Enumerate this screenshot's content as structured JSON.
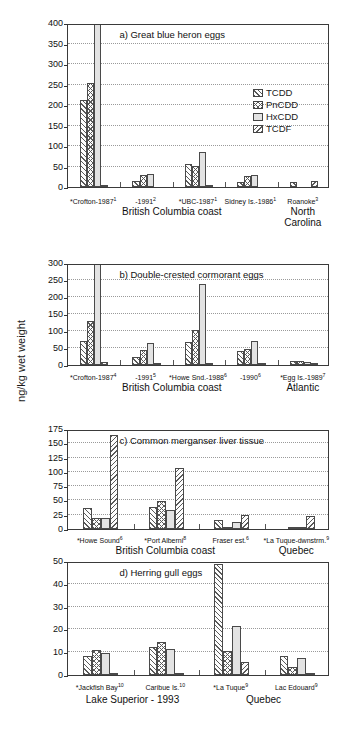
{
  "figure": {
    "ylabel": "ng/kg wet weight"
  },
  "legend": {
    "items": [
      {
        "label": "TCDD",
        "pattern": "diagonal-forward-hatch",
        "color": "#ffffff"
      },
      {
        "label": "PnCDD",
        "pattern": "cross-hatch",
        "color": "#ffffff"
      },
      {
        "label": "HxCDD",
        "pattern": "solid-light-gray",
        "color": "#e3e3e3"
      },
      {
        "label": "TCDF",
        "pattern": "diagonal-back-hatch",
        "color": "#ffffff"
      }
    ]
  },
  "chart_data": [
    {
      "type": "bar",
      "panel": "a",
      "title": "a) Great blue heron eggs",
      "xlabel": "",
      "ylabel": "ng/kg wet weight",
      "ylim": [
        0,
        400
      ],
      "yticks": [
        0,
        50,
        100,
        150,
        200,
        250,
        300,
        350,
        400
      ],
      "grid": true,
      "legend_position": "right-middle",
      "categories": [
        "*Crofton-1987",
        "-1991",
        "*UBC-1987",
        "Sidney Is.-1986",
        "Roanoke"
      ],
      "category_footnotes": [
        "1",
        "2",
        "1",
        "1",
        "3"
      ],
      "series": [
        {
          "name": "TCDD",
          "values": [
            213,
            15,
            57,
            12,
            13
          ]
        },
        {
          "name": "PnCDD",
          "values": [
            254,
            30,
            52,
            26,
            0
          ]
        },
        {
          "name": "HxCDD",
          "values": [
            400,
            32,
            85,
            29,
            0
          ]
        },
        {
          "name": "TCDF",
          "values": [
            3,
            0,
            3,
            0,
            14
          ]
        }
      ],
      "groups": [
        {
          "label": "British Columbia coast",
          "span": 4
        },
        {
          "label": "North Carolina",
          "span": 1
        }
      ]
    },
    {
      "type": "bar",
      "panel": "b",
      "title": "b) Double-crested cormorant eggs",
      "xlabel": "",
      "ylabel": "ng/kg wet weight",
      "ylim": [
        0,
        300
      ],
      "yticks": [
        0,
        50,
        100,
        150,
        200,
        250,
        300
      ],
      "grid": true,
      "categories": [
        "*Crofton-1987",
        "-1991",
        "*Howe Snd.-1988",
        "-1990",
        "*Egg Is.-1989"
      ],
      "category_footnotes": [
        "4",
        "5",
        "6",
        "6",
        "7"
      ],
      "series": [
        {
          "name": "TCDD",
          "values": [
            70,
            25,
            69,
            41,
            13
          ]
        },
        {
          "name": "PnCDD",
          "values": [
            129,
            43,
            102,
            46,
            11
          ]
        },
        {
          "name": "HxCDD",
          "values": [
            300,
            64,
            239,
            72,
            10
          ]
        },
        {
          "name": "TCDF",
          "values": [
            8,
            2,
            4,
            5,
            7
          ]
        }
      ],
      "groups": [
        {
          "label": "British Columbia coast",
          "span": 4
        },
        {
          "label": "Atlantic",
          "span": 1
        }
      ]
    },
    {
      "type": "bar",
      "panel": "c",
      "title": "c) Common merganser liver tissue",
      "xlabel": "",
      "ylabel": "ng/kg wet weight",
      "ylim": [
        0,
        175
      ],
      "yticks": [
        0,
        25,
        50,
        75,
        100,
        125,
        150,
        175
      ],
      "grid": true,
      "categories": [
        "*Howe Sound",
        "*Port Alberni",
        "Fraser est.",
        "*La Tuque-dwnstrm."
      ],
      "category_footnotes": [
        "6",
        "8",
        "6",
        "9"
      ],
      "series": [
        {
          "name": "TCDD",
          "values": [
            37,
            38,
            16,
            0
          ]
        },
        {
          "name": "PnCDD",
          "values": [
            20,
            49,
            2,
            4
          ]
        },
        {
          "name": "HxCDD",
          "values": [
            19,
            34,
            12,
            3
          ]
        },
        {
          "name": "TCDF",
          "values": [
            164,
            106,
            25,
            22
          ]
        }
      ],
      "groups": [
        {
          "label": "British Columbia coast",
          "span": 3
        },
        {
          "label": "Quebec",
          "span": 1
        }
      ]
    },
    {
      "type": "bar",
      "panel": "d",
      "title": "d) Herring gull eggs",
      "xlabel": "",
      "ylabel": "ng/kg wet weight",
      "ylim": [
        0,
        50
      ],
      "yticks": [
        0,
        10,
        20,
        30,
        40,
        50
      ],
      "grid": true,
      "categories": [
        "*Jackfish Bay",
        "Caribue Is.",
        "*La Tuque",
        "Lac Edouard"
      ],
      "category_footnotes": [
        "10",
        "10",
        "9",
        "9"
      ],
      "series": [
        {
          "name": "TCDD",
          "values": [
            8.4,
            12.3,
            48.5,
            8.4
          ]
        },
        {
          "name": "PnCDD",
          "values": [
            11.0,
            14.6,
            10.5,
            3.4
          ]
        },
        {
          "name": "HxCDD",
          "values": [
            9.7,
            11.6,
            21.3,
            7.5
          ]
        },
        {
          "name": "TCDF",
          "values": [
            0.9,
            0.8,
            5.5,
            1.1
          ]
        }
      ],
      "groups": [
        {
          "label": "Lake Superior - 1993",
          "span": 2
        },
        {
          "label": "Quebec",
          "span": 2
        }
      ]
    }
  ]
}
